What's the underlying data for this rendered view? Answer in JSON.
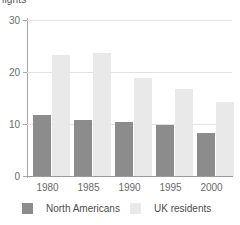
{
  "chart_data": {
    "type": "bar",
    "title": "",
    "axis_title_clipped": "lights",
    "categories": [
      "1980",
      "1985",
      "1990",
      "1995",
      "2000"
    ],
    "series": [
      {
        "name": "North Americans",
        "color": "#8c8c8c",
        "values": [
          11.7,
          10.7,
          10.3,
          9.9,
          8.2
        ]
      },
      {
        "name": "UK residents",
        "color": "#e9e9e9",
        "values": [
          23.3,
          23.6,
          18.9,
          16.8,
          14.2
        ]
      }
    ],
    "xlabel": "",
    "ylabel": "lights",
    "ylim": [
      0,
      30
    ],
    "yticks": [
      0,
      10,
      20,
      30
    ],
    "ytick_labels": [
      "0",
      "10",
      "20",
      "30"
    ],
    "grid": true,
    "legend_position": "bottom"
  },
  "legend": {
    "items": [
      {
        "label": "North Americans"
      },
      {
        "label": "UK residents"
      }
    ]
  }
}
